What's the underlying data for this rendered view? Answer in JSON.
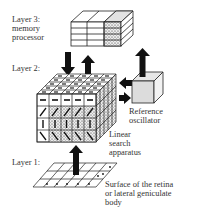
{
  "labels": {
    "layer3_title": "Layer 3:",
    "layer3_name_1": "memory",
    "layer3_name_2": "processor",
    "layer2_title": "Layer 2:",
    "layer1_title": "Layer 1:",
    "oscillator_1": "Reference",
    "oscillator_2": "oscillator",
    "search_1": "Linear",
    "search_2": "search",
    "search_3": "apparatus",
    "surface_1": "Surface of the retina",
    "surface_2": "or lateral geniculate",
    "surface_3": "body"
  },
  "components": [
    {
      "id": "memory-processor",
      "layer": 3,
      "grid": {
        "columns": 3,
        "rows": 4
      }
    },
    {
      "id": "linear-search-apparatus",
      "layer": 2,
      "grid": {
        "columns": 5,
        "rows": 4,
        "depth": 5
      },
      "front_row_glyphs": [
        "horizontal",
        "diagonal-up",
        "vertical",
        "diagonal-down"
      ]
    },
    {
      "id": "reference-oscillator",
      "layer": 2
    },
    {
      "id": "retina-surface",
      "layer": 1,
      "grid": {
        "columns": 6,
        "rows": 3
      }
    }
  ],
  "colors": {
    "stroke": "#222222",
    "shade": "#d8d8d8",
    "background": "#ffffff"
  }
}
